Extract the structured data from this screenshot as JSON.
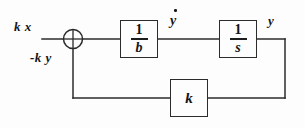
{
  "diagram": {
    "type": "control-system-block-diagram",
    "title": "",
    "background_color": "#fdfdfd",
    "line_color": "#2b2b2b",
    "text_color": "#151515",
    "labels": {
      "input": "k x",
      "feedback_signal": "-k y",
      "intermediate": "y",
      "intermediate_accent": "dot",
      "output": "y"
    },
    "summing_junction": {
      "name": "summing-junction",
      "shape": "circle-with-cross",
      "cx": 73,
      "cy": 39,
      "r": 9.5
    },
    "blocks": [
      {
        "id": "block-1-over-b",
        "kind": "fraction",
        "numerator": "1",
        "denominator": "b",
        "x": 120,
        "y": 20,
        "w": 38,
        "h": 38
      },
      {
        "id": "block-1-over-s",
        "kind": "fraction",
        "numerator": "1",
        "denominator": "s",
        "x": 219,
        "y": 20,
        "w": 38,
        "h": 38
      },
      {
        "id": "block-gain-k",
        "kind": "gain",
        "symbol": "k",
        "x": 170,
        "y": 79,
        "w": 38,
        "h": 38
      }
    ],
    "wires": [
      {
        "id": "wire-input",
        "points": "42,39 63.5,39"
      },
      {
        "id": "wire-sum-to-b",
        "points": "82.5,39 120,39"
      },
      {
        "id": "wire-b-to-s",
        "points": "158,39 219,39"
      },
      {
        "id": "wire-s-to-output",
        "points": "257,39 285,39"
      },
      {
        "id": "wire-output-down",
        "points": "285,39 285,98"
      },
      {
        "id": "wire-output-to-k",
        "points": "285,98 208,98"
      },
      {
        "id": "wire-k-to-left",
        "points": "170,98 73,98"
      },
      {
        "id": "wire-left-up-to-sum",
        "points": "73,98 73,48.5"
      }
    ]
  }
}
